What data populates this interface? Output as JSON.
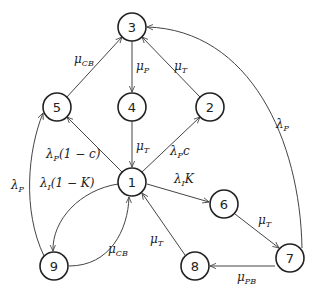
{
  "diagram": {
    "type": "state-transition",
    "nodes": [
      {
        "id": "1",
        "label": "1",
        "x": 132,
        "y": 182
      },
      {
        "id": "2",
        "label": "2",
        "x": 210,
        "y": 107
      },
      {
        "id": "3",
        "label": "3",
        "x": 132,
        "y": 27
      },
      {
        "id": "4",
        "label": "4",
        "x": 132,
        "y": 107
      },
      {
        "id": "5",
        "label": "5",
        "x": 57,
        "y": 107
      },
      {
        "id": "6",
        "label": "6",
        "x": 224,
        "y": 204
      },
      {
        "id": "7",
        "label": "7",
        "x": 290,
        "y": 258
      },
      {
        "id": "8",
        "label": "8",
        "x": 195,
        "y": 266
      },
      {
        "id": "9",
        "label": "9",
        "x": 54,
        "y": 266
      }
    ],
    "edges": [
      {
        "from": "5",
        "to": "3",
        "label": {
          "base": "μ",
          "sub": "CB"
        }
      },
      {
        "from": "3",
        "to": "4",
        "label": {
          "base": "μ",
          "sub": "P"
        }
      },
      {
        "from": "2",
        "to": "3",
        "label": {
          "base": "μ",
          "sub": "T"
        }
      },
      {
        "from": "4",
        "to": "1",
        "label": {
          "base": "μ",
          "sub": "T"
        }
      },
      {
        "from": "1",
        "to": "5",
        "label": {
          "base": "λ",
          "sub": "P",
          "suffix": "(1 − c)"
        }
      },
      {
        "from": "1",
        "to": "2",
        "label": {
          "base": "λ",
          "sub": "P",
          "suffix": "c"
        }
      },
      {
        "from": "1",
        "to": "6",
        "label": {
          "base": "λ",
          "sub": "I",
          "suffix": "K"
        }
      },
      {
        "from": "1",
        "to": "9",
        "label": {
          "base": "λ",
          "sub": "I",
          "suffix": "(1 − K)"
        }
      },
      {
        "from": "9",
        "to": "1",
        "label": {
          "base": "μ",
          "sub": "CB"
        }
      },
      {
        "from": "9",
        "to": "5",
        "label": {
          "base": "λ",
          "sub": "P"
        }
      },
      {
        "from": "6",
        "to": "7",
        "label": {
          "base": "μ",
          "sub": "T"
        }
      },
      {
        "from": "7",
        "to": "8",
        "label": {
          "base": "μ",
          "sub": "PB"
        }
      },
      {
        "from": "8",
        "to": "1",
        "label": {
          "base": "μ",
          "sub": "T"
        }
      },
      {
        "from": "7",
        "to": "3",
        "label": {
          "base": "λ",
          "sub": "P"
        }
      }
    ]
  }
}
